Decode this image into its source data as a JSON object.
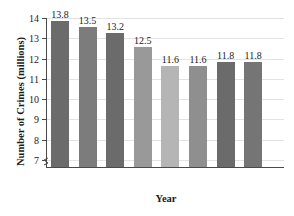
{
  "chart_data": {
    "type": "bar",
    "title_clipped": true,
    "xlabel": "Year",
    "ylabel": "Number of Crimes (millions)",
    "categories": [
      "1995",
      "1996",
      "1997",
      "1998",
      "1999",
      "2000",
      "2001",
      "2002"
    ],
    "values": [
      13.8,
      13.5,
      13.2,
      12.5,
      11.6,
      11.6,
      11.8,
      11.8
    ],
    "value_labels": [
      "13.8",
      "13.5",
      "13.2",
      "12.5",
      "11.6",
      "11.6",
      "11.8",
      "11.8"
    ],
    "bar_colors": [
      "#6b6b6b",
      "#7c7c7c",
      "#6b6b6b",
      "#999999",
      "#b5b5b5",
      "#8f8f8f",
      "#6b6b6b",
      "#757575"
    ],
    "ylim": [
      6.6,
      14.0
    ],
    "yticks": [
      7,
      8,
      9,
      10,
      11,
      12,
      13,
      14
    ],
    "ytick_labels": [
      "7",
      "8",
      "9",
      "10",
      "11",
      "12",
      "13",
      "14"
    ],
    "axis_break": true,
    "grid": "horizontal",
    "legend": null,
    "axis_color": "#4a4a4a",
    "grid_color": "#e3e3e3",
    "text_color": "#1b1b1b"
  }
}
